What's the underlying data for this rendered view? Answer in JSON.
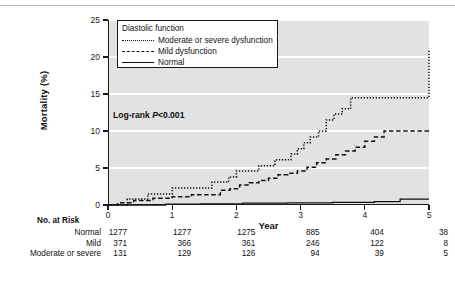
{
  "figure": {
    "background": "#ffffff",
    "plot_background": "#e2e2e2",
    "gridline_color": "#ffffff",
    "axis_color": "#1a1a1a"
  },
  "annotation": {
    "logrank_prefix": "Log-rank ",
    "logrank_p": "P",
    "logrank_value": "<0.001"
  },
  "legend": {
    "title": "Diastolic function",
    "items": [
      {
        "label": "Moderate or severe dysfunction",
        "style": "dotted"
      },
      {
        "label": "Mild dysfunction",
        "style": "dashed"
      },
      {
        "label": "Normal",
        "style": "solid"
      }
    ]
  },
  "risk_table": {
    "title": "No. at Risk",
    "row_labels": [
      "Normal",
      "Mild",
      "Moderate or severe"
    ],
    "columns": [
      "0",
      "1",
      "2",
      "3",
      "4",
      "5"
    ],
    "rows": [
      {
        "label": "Normal",
        "values": [
          "1277",
          "1277",
          "1275",
          "885",
          "404",
          "38"
        ]
      },
      {
        "label": "Mild",
        "values": [
          "371",
          "366",
          "361",
          "246",
          "122",
          "8"
        ]
      },
      {
        "label": "Moderate or severe",
        "values": [
          "131",
          "129",
          "126",
          "94",
          "39",
          "5"
        ]
      }
    ]
  },
  "chart_data": {
    "type": "line",
    "title": "",
    "xlabel": "Year",
    "ylabel": "Mortality (%)",
    "xlim": [
      0,
      5
    ],
    "ylim": [
      0,
      25
    ],
    "xticks": [
      0,
      1,
      2,
      3,
      4,
      5
    ],
    "yticks": [
      0,
      5,
      10,
      15,
      20,
      25
    ],
    "grid": "horizontal",
    "legend_position": "top-left",
    "step_type": "post",
    "series": [
      {
        "name": "Moderate or severe dysfunction",
        "style": "dotted",
        "color": "#111111",
        "x": [
          0.0,
          0.18,
          0.3,
          0.45,
          0.62,
          0.8,
          1.0,
          1.15,
          1.3,
          1.45,
          1.62,
          1.72,
          1.88,
          2.0,
          2.1,
          2.22,
          2.35,
          2.48,
          2.6,
          2.72,
          2.85,
          2.95,
          3.05,
          3.15,
          3.28,
          3.4,
          3.52,
          3.65,
          3.78,
          4.65,
          5.0
        ],
        "y": [
          0.0,
          0.0,
          0.8,
          0.8,
          1.5,
          1.5,
          2.3,
          2.3,
          2.3,
          2.3,
          3.1,
          3.1,
          3.8,
          4.6,
          4.6,
          4.6,
          5.3,
          5.3,
          6.1,
          6.1,
          6.9,
          7.6,
          8.4,
          9.2,
          10.0,
          11.5,
          12.3,
          13.0,
          14.5,
          14.5,
          21.0
        ]
      },
      {
        "name": "Mild dysfunction",
        "style": "dashed",
        "color": "#111111",
        "x": [
          0.0,
          0.15,
          0.28,
          0.4,
          0.55,
          0.7,
          0.85,
          1.0,
          1.15,
          1.3,
          1.45,
          1.6,
          1.75,
          1.9,
          2.05,
          2.2,
          2.35,
          2.5,
          2.65,
          2.8,
          2.95,
          3.1,
          3.25,
          3.4,
          3.55,
          3.7,
          3.85,
          4.0,
          4.15,
          4.3,
          5.0
        ],
        "y": [
          0.0,
          0.3,
          0.3,
          0.6,
          0.6,
          0.9,
          0.9,
          1.1,
          1.1,
          1.4,
          1.4,
          1.4,
          2.0,
          2.2,
          2.7,
          3.0,
          3.3,
          3.6,
          4.1,
          4.3,
          4.6,
          5.1,
          5.7,
          6.2,
          6.8,
          7.3,
          7.8,
          8.6,
          9.2,
          10.0,
          10.0
        ]
      },
      {
        "name": "Normal",
        "style": "solid",
        "color": "#111111",
        "x": [
          0.0,
          0.35,
          0.9,
          1.45,
          2.1,
          2.8,
          3.5,
          4.15,
          4.55,
          5.0
        ],
        "y": [
          0.0,
          0.0,
          0.1,
          0.15,
          0.25,
          0.3,
          0.35,
          0.45,
          0.8,
          0.8
        ]
      }
    ]
  }
}
